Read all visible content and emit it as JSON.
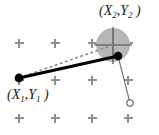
{
  "figure": {
    "title": "",
    "background_color": "#ffffff",
    "labels": {
      "point1": {
        "open_paren": "(",
        "x_var": "X",
        "x_sub": "1",
        "comma": ",",
        "y_var": "Y",
        "y_sub": "1",
        "close_paren": " )"
      },
      "point2": {
        "open_paren": "(",
        "x_var": "X",
        "x_sub": "2",
        "comma": ",",
        "y_var": "Y",
        "y_sub": "2",
        "close_paren": " )"
      }
    },
    "colors": {
      "line_solid": "#000000",
      "line_dashed": "#8a8a8a",
      "line_thin": "#6e6e6e",
      "disc_fill": "#b3b3b3",
      "crosshair": "#4d4d4d",
      "plus_mark": "#808080",
      "dot_fill": "#000000",
      "open_circle_stroke": "#6e6e6e",
      "text": "#1a1a1a"
    },
    "geometry": {
      "point1": {
        "x": 19,
        "y": 78
      },
      "point2": {
        "x": 118,
        "y": 56
      },
      "crosshair_center": {
        "x": 113,
        "y": 45
      },
      "open_circle": {
        "x": 130,
        "y": 103
      },
      "disc": {
        "cx": 113,
        "cy": 45,
        "r": 17
      },
      "plus_columns": [
        19,
        55,
        92,
        128
      ],
      "plus_rows": [
        43,
        80,
        118
      ],
      "plus_size": 5,
      "solid_line_width": 3,
      "dashed_line_width": 1.4,
      "thin_line_width": 1,
      "dot_radius": 4.2,
      "open_circle_radius": 3.2
    }
  }
}
